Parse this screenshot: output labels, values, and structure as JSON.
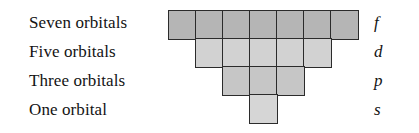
{
  "diagram": {
    "rows": [
      {
        "label": "Seven orbitals",
        "letter": "f",
        "count": 7,
        "fill": "#b5b5b5"
      },
      {
        "label": "Five orbitals",
        "letter": "d",
        "count": 5,
        "fill": "#d2d2d2"
      },
      {
        "label": "Three orbitals",
        "letter": "p",
        "count": 3,
        "fill": "#c6c6c6"
      },
      {
        "label": "One orbital",
        "letter": "s",
        "count": 1,
        "fill": "#d6d6d6"
      }
    ],
    "colors": {
      "background": "#ffffff",
      "cell_border": "#2b2b2b",
      "text": "#131313"
    }
  }
}
